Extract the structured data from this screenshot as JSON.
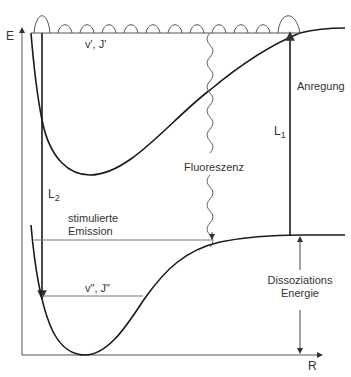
{
  "diagram": {
    "type": "potential-energy-curves",
    "axes": {
      "y_label": "E",
      "x_label": "R"
    },
    "labels": {
      "upper_level": "v', J'",
      "lower_level": "v\", J\"",
      "excitation": "Anregung",
      "l1": "L",
      "l1_sub": "1",
      "l2": "L",
      "l2_sub": "2",
      "fluorescence": "Fluoreszenz",
      "stim_line1": "stimulierte",
      "stim_line2": "Emission",
      "dissoc_line1": "Dissoziations",
      "dissoc_line2": "Energie"
    },
    "colors": {
      "curve": "#1a1a1a",
      "line": "#444444",
      "thin": "#777777",
      "text": "#333333"
    }
  }
}
